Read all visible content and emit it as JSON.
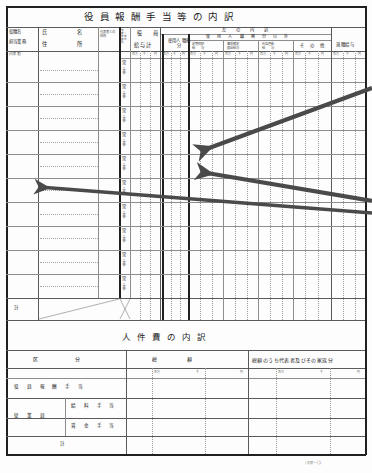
{
  "document": {
    "title_top": "役員報酬手当等の内訳",
    "title_bottom": "人件費の内訳",
    "footer_code": "(別表一〇)"
  },
  "top_table": {
    "left_headers": {
      "yakushokumei": "役職名",
      "tantougyoumu": "担当業務",
      "daihyousha_mark": "(代表者)",
      "shimei": "氏　　　　名",
      "juusho": "住　　　　所",
      "kankei": "代表者との関係",
      "joukin_kubun": "常勤・非常勤の別"
    },
    "yakuin_group": {
      "group_label": "役　員",
      "sub_label": "給与計"
    },
    "hidari_no_uchiwake": "左　の　内　訳",
    "shiyounin_shokumubun": "使用人\n職務分",
    "shiyounin_igai_group": "使　用　人　職　務　分　以　外",
    "igai_columns": [
      "定期同額\n給　　与",
      "事前確定\n届出給与",
      "利益連動\n給　　与",
      "そ　の　他"
    ],
    "taishoku_kyuyo": "退職給与",
    "units": [
      "百万",
      "千",
      "円"
    ],
    "joukin_cell_text": "常・非",
    "total_label": "計",
    "data_row_count": 10
  },
  "bottom_table": {
    "col_headers": {
      "kubun": "区　　　　　分",
      "sougaku": "総　　　　額",
      "uchi_daihyousha": "総額のうち代表者及びその家族分"
    },
    "units": [
      "百万",
      "千",
      "円"
    ],
    "rows": [
      {
        "group": "",
        "label": "役　員　報　酬　手　当",
        "span": true
      },
      {
        "group": "従　業　員",
        "label": "給　料　手　当",
        "span": false
      },
      {
        "group": "従　業　員",
        "label": "賃　金　手　当",
        "span": false
      },
      {
        "group": "",
        "label": "計",
        "span": true
      }
    ]
  },
  "annotations": {
    "arrow_color": "#4a4a4a",
    "arrows": [
      {
        "name": "arrow-to-shiyounin-shokumubun-upper",
        "from_x": 372,
        "from_y": 88,
        "to_x": 196,
        "to_y": 152
      },
      {
        "name": "arrow-to-shiyounin-shokumubun-lower",
        "from_x": 372,
        "from_y": 200,
        "to_x": 196,
        "to_y": 172
      },
      {
        "name": "arrow-to-left-name-column",
        "from_x": 372,
        "from_y": 212,
        "to_x": 33,
        "to_y": 188
      }
    ]
  }
}
